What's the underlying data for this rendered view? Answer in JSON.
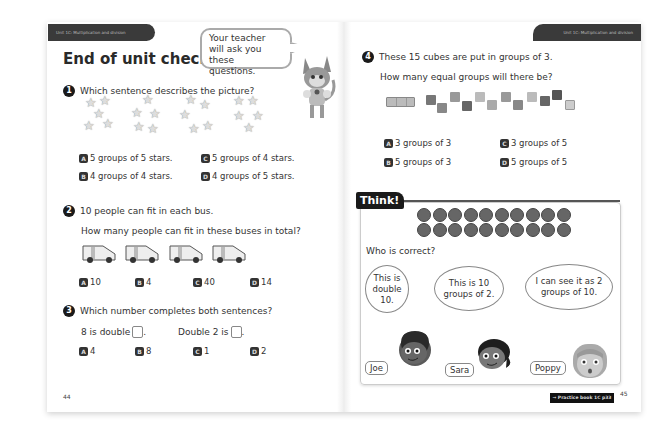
{
  "left_page": {
    "unit_header": "Unit 1C: Multiplication and division",
    "title": "End of unit check",
    "teacher_bubble": "Your teacher will ask you these questions.",
    "page_number": "44",
    "q1": {
      "number": "1",
      "text": "Which sentence describes the picture?",
      "image": "4 groups of 5 stars",
      "options": [
        {
          "letter": "A",
          "text": "5 groups of 5 stars."
        },
        {
          "letter": "C",
          "text": "5 groups of 4 stars."
        },
        {
          "letter": "B",
          "text": "4 groups of 4 stars."
        },
        {
          "letter": "D",
          "text": "4 groups of 5 stars."
        }
      ]
    },
    "q2": {
      "number": "2",
      "text": "10 people can fit in each bus.",
      "subtext": "How many people can fit in these buses in total?",
      "image": "4 buses",
      "options": [
        {
          "letter": "A",
          "text": "10"
        },
        {
          "letter": "B",
          "text": "4"
        },
        {
          "letter": "C",
          "text": "40"
        },
        {
          "letter": "D",
          "text": "14"
        }
      ]
    },
    "q3": {
      "number": "3",
      "text": "Which number completes both sentences?",
      "sentence1": "8 is double",
      "sentence2": "Double 2 is",
      "options": [
        {
          "letter": "A",
          "text": "4"
        },
        {
          "letter": "B",
          "text": "8"
        },
        {
          "letter": "C",
          "text": "1"
        },
        {
          "letter": "D",
          "text": "2"
        }
      ]
    }
  },
  "right_page": {
    "unit_header": "Unit 1C: Multiplication and division",
    "page_number": "45",
    "practice_link": "→ Practice book 1C p33",
    "q4": {
      "number": "4",
      "text": "These 15 cubes are put in groups of 3.",
      "subtext": "How many equal groups will there be?",
      "options": [
        {
          "letter": "A",
          "text": "3 groups of 3"
        },
        {
          "letter": "C",
          "text": "3 groups of 5"
        },
        {
          "letter": "B",
          "text": "5 groups of 3"
        },
        {
          "letter": "D",
          "text": "5 groups of 5"
        }
      ]
    },
    "think": {
      "label": "Think!",
      "dots_rows": 2,
      "dots_per_row": 10,
      "question": "Who is correct?",
      "characters": [
        {
          "name": "Joe",
          "speech": "This is double 10."
        },
        {
          "name": "Sara",
          "speech": "This is 10 groups of 2."
        },
        {
          "name": "Poppy",
          "speech": "I can see it as 2 groups of 10."
        }
      ]
    }
  }
}
